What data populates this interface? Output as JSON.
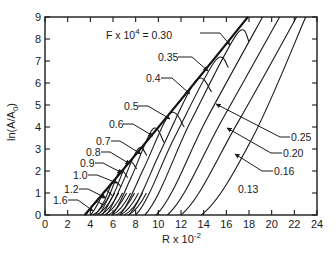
{
  "chart_data": {
    "type": "line",
    "title": "",
    "xlabel": "R x 10^-2",
    "xlabel_base": "R x 10",
    "xlabel_exp": "-2",
    "ylabel": "ln(A/A0)",
    "xlim": [
      0,
      24
    ],
    "ylim": [
      0,
      9
    ],
    "grid": false,
    "legend": "none (curves labeled directly with leader arrows)",
    "x_ticks": [
      "0",
      "2",
      "4",
      "6",
      "8",
      "10",
      "12",
      "14",
      "16",
      "18",
      "20",
      "22",
      "24"
    ],
    "y_ticks": [
      "0",
      "1",
      "2",
      "3",
      "4",
      "5",
      "6",
      "7",
      "8",
      "9"
    ],
    "parameter_label_prefix": "F x 10",
    "parameter_label_exp": "4",
    "series": [
      {
        "name": "1.6",
        "label": "1.6",
        "start_R": 3.6,
        "points": [
          [
            3.6,
            0
          ],
          [
            4.0,
            0.3
          ],
          [
            4.6,
            0.6
          ],
          [
            5.1,
            0.45
          ]
        ]
      },
      {
        "name": "1.2",
        "label": "1.2",
        "start_R": 4.0,
        "points": [
          [
            4.0,
            0
          ],
          [
            4.6,
            0.45
          ],
          [
            5.3,
            1.1
          ],
          [
            5.9,
            0.9
          ]
        ]
      },
      {
        "name": "1.0",
        "label": "1.0",
        "start_R": 4.4,
        "points": [
          [
            4.4,
            0
          ],
          [
            5.2,
            0.6
          ],
          [
            6.0,
            1.5
          ],
          [
            6.7,
            1.3
          ]
        ]
      },
      {
        "name": "0.9",
        "label": "0.9",
        "start_R": 4.7,
        "points": [
          [
            4.7,
            0
          ],
          [
            5.6,
            0.8
          ],
          [
            6.6,
            2.0
          ],
          [
            7.3,
            1.7
          ]
        ]
      },
      {
        "name": "0.8",
        "label": "0.8",
        "start_R": 5.0,
        "points": [
          [
            5.0,
            0
          ],
          [
            6.1,
            1.0
          ],
          [
            7.3,
            2.4
          ],
          [
            8.1,
            2.1
          ]
        ]
      },
      {
        "name": "0.7",
        "label": "0.7",
        "start_R": 5.4,
        "points": [
          [
            5.4,
            0
          ],
          [
            6.7,
            1.3
          ],
          [
            8.2,
            3.0
          ],
          [
            9.0,
            2.7
          ]
        ]
      },
      {
        "name": "0.6",
        "label": "0.6",
        "start_R": 5.9,
        "points": [
          [
            5.9,
            0
          ],
          [
            7.6,
            1.7
          ],
          [
            9.5,
            3.9
          ],
          [
            10.5,
            3.3
          ]
        ]
      },
      {
        "name": "0.5",
        "label": "0.5",
        "start_R": 6.6,
        "points": [
          [
            6.6,
            0
          ],
          [
            8.7,
            2.1
          ],
          [
            11.0,
            4.6
          ],
          [
            12.3,
            4.0
          ]
        ]
      },
      {
        "name": "0.4",
        "label": "0.4",
        "start_R": 7.4,
        "points": [
          [
            7.4,
            0
          ],
          [
            10.2,
            2.9
          ],
          [
            13.3,
            6.1
          ],
          [
            14.7,
            5.6
          ]
        ]
      },
      {
        "name": "0.35",
        "label": "0.35",
        "start_R": 8.0,
        "points": [
          [
            8.0,
            0
          ],
          [
            11.4,
            3.5
          ],
          [
            15.0,
            7.0
          ],
          [
            16.2,
            6.7
          ]
        ]
      },
      {
        "name": "0.30",
        "label": "F x 10^4 = 0.30",
        "start_R": 8.8,
        "points": [
          [
            8.8,
            0
          ],
          [
            12.8,
            4.2
          ],
          [
            16.9,
            8.2
          ],
          [
            18.0,
            7.9
          ]
        ]
      },
      {
        "name": "0.25",
        "label": "0.25",
        "start_R": 9.8,
        "points": [
          [
            9.8,
            0
          ],
          [
            14.3,
            4.4
          ],
          [
            19.2,
            9.0
          ]
        ]
      },
      {
        "name": "0.20",
        "label": "0.20",
        "start_R": 10.8,
        "points": [
          [
            10.8,
            0
          ],
          [
            15.6,
            4.3
          ],
          [
            20.7,
            9.0
          ]
        ]
      },
      {
        "name": "0.16",
        "label": "0.16",
        "start_R": 12.0,
        "points": [
          [
            12.0,
            0
          ],
          [
            17.0,
            4.2
          ],
          [
            22.2,
            9.0
          ]
        ]
      },
      {
        "name": "0.13",
        "label": "0.13",
        "start_R": 13.8,
        "points": [
          [
            13.8,
            0
          ],
          [
            18.4,
            3.6
          ],
          [
            23.0,
            9.0
          ]
        ]
      }
    ],
    "envelope": {
      "name": "maximum envelope",
      "points": [
        [
          3.5,
          0
        ],
        [
          17.9,
          9.0
        ]
      ]
    }
  },
  "labels": {
    "f030": "F x 10",
    "f030_exp": "4",
    "f030_val": " = 0.30",
    "f035": "0.35",
    "f04": "0.4",
    "f05": "0.5",
    "f06": "0.6",
    "f07": "0.7",
    "f08": "0.8",
    "f09": "0.9",
    "f10": "1.0",
    "f12": "1.2",
    "f16": "1.6",
    "f025": "0.25",
    "f020": "0.20",
    "f016": "0.16",
    "f013": "0.13"
  },
  "axes": {
    "x_ticks": [
      "0",
      "2",
      "4",
      "6",
      "8",
      "10",
      "12",
      "14",
      "16",
      "18",
      "20",
      "22",
      "24"
    ],
    "y_ticks": [
      "0",
      "1",
      "2",
      "3",
      "4",
      "5",
      "6",
      "7",
      "8",
      "9"
    ],
    "xlabel_base": "R x 10",
    "xlabel_exp": "-2",
    "ylabel": "ln(A/A0)",
    "ylabel_main": "ln(A/A",
    "ylabel_sub": "0",
    "ylabel_close": ")"
  }
}
